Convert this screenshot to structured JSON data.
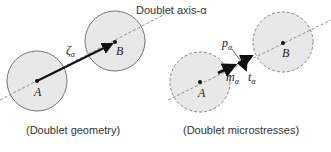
{
  "axis_label": "Doublet axis-α",
  "left_panel": {
    "caption": "(Doublet geometry)",
    "point_a": "A",
    "point_b": "B",
    "vector_symbol": "ζ",
    "vector_sub": "α"
  },
  "right_panel": {
    "caption": "(Doublet microstresses)",
    "point_a": "A",
    "point_b": "B",
    "p_symbol": "p",
    "p_sub": "α",
    "m_symbol": "m",
    "m_sub": "α",
    "t_symbol": "t",
    "t_sub": "α"
  },
  "colors": {
    "circle_fill": "#e8e8e8",
    "circle_stroke": "#777777",
    "arrow": "#111111",
    "axis_line": "#777777"
  }
}
